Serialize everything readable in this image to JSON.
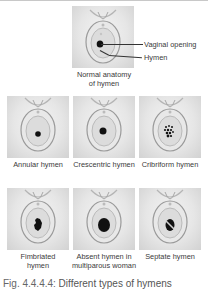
{
  "figure": {
    "main": {
      "title": "Normal anatomy of hymen",
      "title_lines": [
        "Normal anatomy",
        "of hymen"
      ],
      "callouts": [
        "Vaginal opening",
        "Hymen"
      ]
    },
    "panels": [
      {
        "id": "annular",
        "lines": [
          "Annular hymen"
        ],
        "opening": "small-round"
      },
      {
        "id": "crescentric",
        "lines": [
          "Crescentric hymen"
        ],
        "opening": "crescent"
      },
      {
        "id": "cribriform",
        "lines": [
          "Cribriform hymen"
        ],
        "opening": "multiple-small"
      },
      {
        "id": "fimbriated",
        "lines": [
          "Fimbriated",
          "hymen"
        ],
        "opening": "fringed"
      },
      {
        "id": "absent",
        "lines": [
          "Absent hymen in",
          "multiparous woman"
        ],
        "opening": "large-round"
      },
      {
        "id": "septate",
        "lines": [
          "Septate hymen"
        ],
        "opening": "divided"
      }
    ],
    "caption": {
      "number": "Fig. 4.4.4.4:",
      "text": "Different types of hymens"
    }
  },
  "colors": {
    "background": "#ffffff",
    "illustration_gray": "#d8d8d8",
    "opening": "#111111",
    "text": "#3a3a3a"
  }
}
